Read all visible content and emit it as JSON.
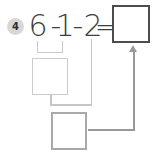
{
  "worksheet": {
    "problem_number": "4",
    "expression": {
      "term1": "6",
      "minus1": "-",
      "term2": "1",
      "minus2": "-",
      "term3": "2",
      "equals": "="
    },
    "boxes": {
      "answer_value": "",
      "step1_value": "",
      "step2_value": ""
    },
    "icons": {
      "answer_arrow": "arrow-up"
    },
    "colors": {
      "badge_bg": "#d8d8d8",
      "text": "#3d3d3d",
      "step1_box_border": "#cccccc",
      "step2_box_border": "#a9a9a9",
      "answer_box_border": "#4d4d4d",
      "connector_line": "#c6c6c6",
      "arrow": "#999999"
    }
  }
}
